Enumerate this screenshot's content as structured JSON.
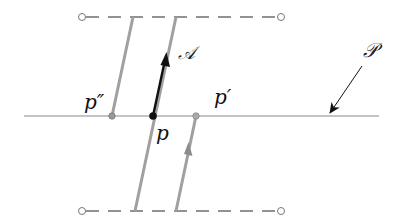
{
  "diagram": {
    "labels": {
      "p": "p",
      "p_prime": "p′",
      "p_double_prime": "p″",
      "vector": "𝒜",
      "plane": "𝒫"
    },
    "colors": {
      "ink": "#111111",
      "gray_line": "#9a9a9a",
      "dash": "#6f6f6f",
      "plane_line": "#888888"
    }
  }
}
